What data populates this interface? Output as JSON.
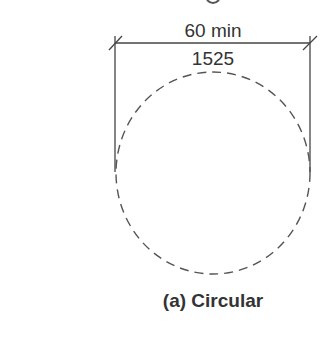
{
  "diagram": {
    "dimension": {
      "imperial_label": "60 min",
      "metric_label": "1525"
    },
    "caption": "(a) Circular",
    "colors": {
      "line": "#444444",
      "text": "#333333",
      "background": "#ffffff"
    }
  }
}
